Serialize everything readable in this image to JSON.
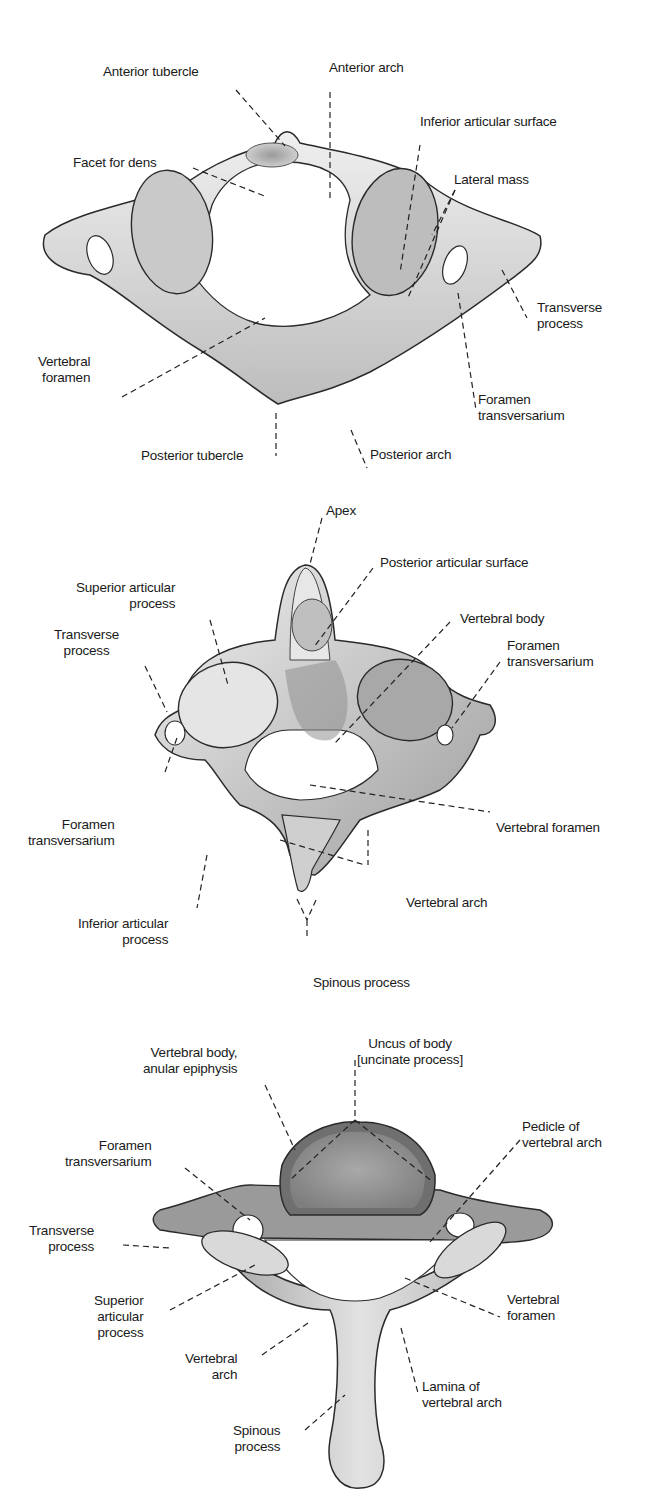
{
  "figures": [
    {
      "id": "atlas",
      "view": "superior view of atlas (C1)",
      "labels": {
        "anterior_tubercle": "Anterior tubercle",
        "anterior_arch": "Anterior arch",
        "inferior_articular_surface": "Inferior articular surface",
        "facet_for_dens": "Facet for dens",
        "lateral_mass": "Lateral mass",
        "transverse_process": [
          "Transverse",
          "process"
        ],
        "vertebral_foramen": [
          "Vertebral",
          "foramen"
        ],
        "foramen_transversarium": [
          "Foramen",
          "transversarium"
        ],
        "posterior_tubercle": "Posterior tubercle",
        "posterior_arch": "Posterior arch"
      }
    },
    {
      "id": "axis",
      "view": "posterosuperior view of axis (C2)",
      "labels": {
        "apex": "Apex",
        "posterior_articular_surface": "Posterior articular surface",
        "superior_articular_process": [
          "Superior articular",
          "process"
        ],
        "vertebral_body": "Vertebral body",
        "transverse_process": [
          "Transverse",
          "process"
        ],
        "foramen_transversarium_right": [
          "Foramen",
          "transversarium"
        ],
        "foramen_transversarium_left": [
          "Foramen",
          "transversarium"
        ],
        "vertebral_foramen": "Vertebral foramen",
        "vertebral_arch": "Vertebral arch",
        "inferior_articular_process": [
          "Inferior articular",
          "process"
        ],
        "spinous_process": "Spinous process"
      }
    },
    {
      "id": "typical_cervical",
      "view": "superior view of typical cervical vertebra",
      "labels": {
        "vertebral_body_anular_epiphysis": [
          "Vertebral body,",
          "anular epiphysis"
        ],
        "uncus_of_body": [
          "Uncus of body",
          "[uncinate process]"
        ],
        "pedicle_of_vertebral_arch": [
          "Pedicle of",
          "vertebral arch"
        ],
        "foramen_transversarium": [
          "Foramen",
          "transversarium"
        ],
        "transverse_process": [
          "Transverse",
          "process"
        ],
        "superior_articular_process": [
          "Superior",
          "articular",
          "process"
        ],
        "vertebral_foramen": [
          "Vertebral",
          "foramen"
        ],
        "vertebral_arch": [
          "Vertebral",
          "arch"
        ],
        "lamina_of_vertebral_arch": [
          "Lamina of",
          "vertebral arch"
        ],
        "spinous_process": [
          "Spinous",
          "process"
        ]
      }
    }
  ],
  "colors": {
    "bone_fill": "#d9d9d9",
    "bone_light": "#eeeeee",
    "bone_dark": "#8a8a8a",
    "outline": "#2a2a2a",
    "leader": "#222222",
    "text": "#1a1a1a",
    "background": "#ffffff"
  }
}
